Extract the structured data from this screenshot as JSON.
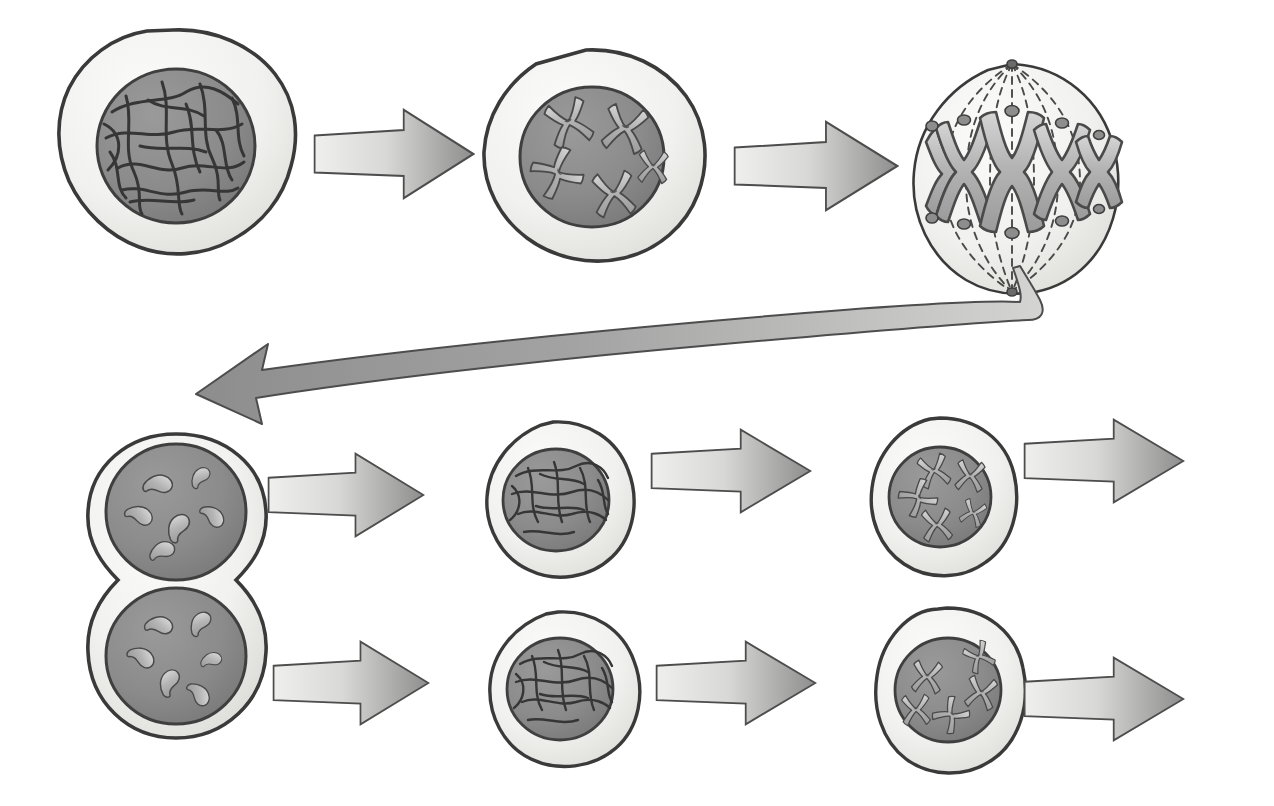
{
  "diagram": {
    "title": "Mitotic cell cycle illustration",
    "background_color": "#ffffff",
    "palette": {
      "cytoplasm_fill": "#f2f2f0",
      "cytoplasm_fill_shadow": "#e2e2de",
      "cell_outline": "#3a3a3a",
      "nucleus_fill": "#8d8d8d",
      "nucleus_fill_dark": "#7a7a7a",
      "nucleus_outline": "#3f3f3f",
      "chromatin_stroke": "#3b3b3b",
      "chromosome_fill": "#b9b9b9",
      "chromosome_outline": "#4a4a4a",
      "kinetochore_fill": "#8a8a8a",
      "spindle_stroke": "#4a4a4a",
      "arrow_light": "#ededeb",
      "arrow_dark": "#8f8f8f",
      "arrow_outline": "#4d4d4d",
      "return_arrow_light": "#c9c9c9",
      "return_arrow_dark": "#8c8c8c"
    },
    "rows": [
      {
        "name": "top-row",
        "label": "First division sequence",
        "stages": [
          {
            "id": "interphase-1",
            "label": "Interphase cell with diffuse chromatin",
            "kind": "interphase",
            "cx": 175,
            "cy": 140,
            "rx": 120,
            "ry": 110
          },
          {
            "id": "prophase-1",
            "label": "Prophase cell with condensed duplicated chromosomes",
            "kind": "prophase",
            "cx": 590,
            "cy": 155,
            "rx": 112,
            "ry": 105,
            "chromosome_count": 5
          },
          {
            "id": "metaphase-1",
            "label": "Metaphase spindle with chromosomes on equator",
            "kind": "metaphase",
            "cx": 1012,
            "cy": 170,
            "rx": 100,
            "ry": 105,
            "chromosome_count": 5
          }
        ],
        "arrows": [
          {
            "id": "arrow-interphase-to-prophase",
            "label": "Arrow to prophase",
            "x": 313,
            "y": 155,
            "length": 160,
            "height": 86,
            "direction": "right"
          },
          {
            "id": "arrow-prophase-to-metaphase",
            "label": "Arrow to metaphase",
            "x": 733,
            "y": 165,
            "length": 165,
            "height": 86,
            "direction": "right"
          }
        ]
      },
      {
        "name": "return",
        "label": "Return path from metaphase to daughter cells",
        "arrows": [
          {
            "id": "arrow-return-to-daughters",
            "label": "Curved return arrow to daughter cells",
            "direction": "left-curved",
            "from": "metaphase-1",
            "to": "telophase-1"
          }
        ]
      },
      {
        "name": "middle-row",
        "label": "Daughter cell A sequence",
        "stages": [
          {
            "id": "telophase-1",
            "label": "Telophase / cytokinesis — two daughter nuclei",
            "kind": "cytokinesis",
            "cx": 176,
            "cy": 600,
            "rx": 90,
            "ry": 168,
            "nuclei": 2
          },
          {
            "id": "interphase-2a",
            "label": "Daughter cell A in interphase",
            "kind": "interphase",
            "cx": 554,
            "cy": 500,
            "rx": 76,
            "ry": 72
          },
          {
            "id": "prophase-2a",
            "label": "Daughter cell A in prophase",
            "kind": "prophase",
            "cx": 940,
            "cy": 495,
            "rx": 72,
            "ry": 74,
            "chromosome_count": 5
          }
        ],
        "arrows": [
          {
            "id": "arrow-telophase-to-interphase-a",
            "label": "Arrow to daughter A interphase",
            "x": 267,
            "y": 500,
            "length": 155,
            "height": 80,
            "direction": "right"
          },
          {
            "id": "arrow-interphase-a-to-prophase-a",
            "label": "Arrow to daughter A prophase",
            "x": 650,
            "y": 472,
            "length": 160,
            "height": 80,
            "direction": "right"
          },
          {
            "id": "arrow-prophase-a-out",
            "label": "Arrow continuing cycle from daughter A",
            "x": 1023,
            "y": 462,
            "length": 160,
            "height": 80,
            "direction": "right"
          }
        ]
      },
      {
        "name": "bottom-row",
        "label": "Daughter cell B sequence",
        "stages": [
          {
            "id": "interphase-2b",
            "label": "Daughter cell B in interphase",
            "kind": "interphase",
            "cx": 558,
            "cy": 688,
            "rx": 76,
            "ry": 73
          },
          {
            "id": "prophase-2b",
            "label": "Daughter cell B in prophase",
            "kind": "prophase",
            "cx": 947,
            "cy": 688,
            "rx": 74,
            "ry": 76,
            "chromosome_count": 5
          }
        ],
        "arrows": [
          {
            "id": "arrow-telophase-to-interphase-b",
            "label": "Arrow to daughter B interphase",
            "x": 272,
            "y": 688,
            "length": 155,
            "height": 80,
            "direction": "right"
          },
          {
            "id": "arrow-interphase-b-to-prophase-b",
            "label": "Arrow to daughter B prophase",
            "x": 655,
            "y": 682,
            "length": 160,
            "height": 80,
            "direction": "right"
          },
          {
            "id": "arrow-prophase-b-out",
            "label": "Arrow continuing cycle from daughter B",
            "x": 1023,
            "y": 700,
            "length": 160,
            "height": 80,
            "direction": "right"
          }
        ]
      }
    ]
  }
}
